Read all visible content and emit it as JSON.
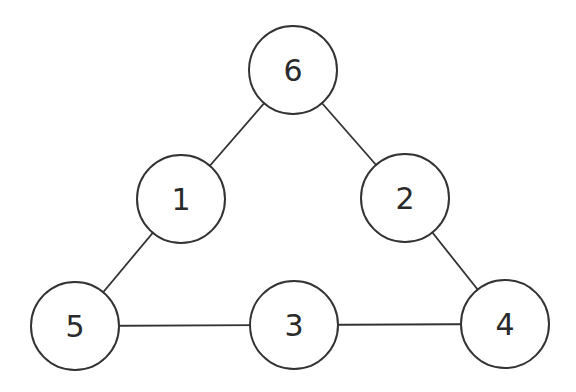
{
  "diagram": {
    "type": "graph",
    "stroke_color": "#333333",
    "node_radius": 44,
    "nodes": [
      {
        "id": "6",
        "label": "6",
        "x": 293,
        "y": 70
      },
      {
        "id": "1",
        "label": "1",
        "x": 181,
        "y": 199
      },
      {
        "id": "2",
        "label": "2",
        "x": 405,
        "y": 198
      },
      {
        "id": "5",
        "label": "5",
        "x": 75,
        "y": 326
      },
      {
        "id": "3",
        "label": "3",
        "x": 294,
        "y": 325
      },
      {
        "id": "4",
        "label": "4",
        "x": 505,
        "y": 324
      }
    ],
    "edges": [
      {
        "from": "6",
        "to": "1"
      },
      {
        "from": "6",
        "to": "2"
      },
      {
        "from": "1",
        "to": "5"
      },
      {
        "from": "2",
        "to": "4"
      },
      {
        "from": "5",
        "to": "3"
      },
      {
        "from": "3",
        "to": "4"
      }
    ]
  }
}
